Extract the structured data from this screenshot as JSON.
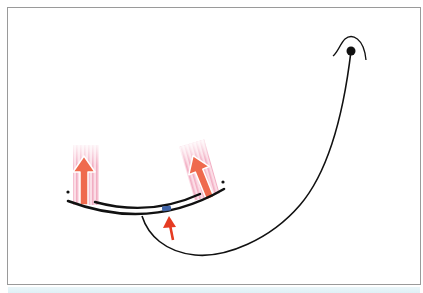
{
  "figure": {
    "type": "anatomical-diagram",
    "colors": {
      "frame_border": "#9a9a9a",
      "line": "#111111",
      "muscle_band": "#f6c9d6",
      "muscle_stripe": "#f2a9c0",
      "pull_arrow": "#ef6a4e",
      "pull_arrow_outline": "#ffffff",
      "force_arrow": "#e53b22",
      "marker": "#3f63a8",
      "bottom_strip": "#e4f3f7"
    },
    "elements": {
      "anchor_dot": {
        "cx": 351,
        "cy": 51,
        "r": 4.5
      },
      "left_muscle": {
        "direction": "up"
      },
      "right_muscle": {
        "direction": "up-left"
      },
      "force_arrow": {
        "direction": "up"
      },
      "marker": {
        "label": ""
      }
    }
  }
}
